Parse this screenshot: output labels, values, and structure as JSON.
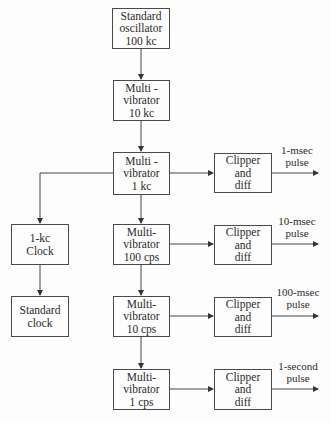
{
  "diagram": {
    "type": "block-diagram",
    "blocks": {
      "oscillator": {
        "label": "Standard\noscillator\n100 kc"
      },
      "mv_10kc": {
        "label": "Multi -\nvibrator\n10 kc"
      },
      "mv_1kc": {
        "label": "Multi -\nvibrator\n1 kc"
      },
      "mv_100cps": {
        "label": "Multi-\nvibrator\n100 cps"
      },
      "mv_10cps": {
        "label": "Multi-\nvibrator\n10 cps"
      },
      "mv_1cps": {
        "label": "Multi-\nvibrator\n1 cps"
      },
      "clock_1kc": {
        "label": "1-kc\nClock"
      },
      "standard_clock": {
        "label": "Standard\nclock"
      },
      "clipper_1": {
        "label": "Clipper\nand\ndiff"
      },
      "clipper_2": {
        "label": "Clipper\nand\ndiff"
      },
      "clipper_3": {
        "label": "Clipper\nand\ndiff"
      },
      "clipper_4": {
        "label": "Clipper\nand\ndiff"
      }
    },
    "outputs": {
      "out_1": {
        "label": "1-msec\npulse"
      },
      "out_2": {
        "label": "10-msec\npulse"
      },
      "out_3": {
        "label": "100-msec\npulse"
      },
      "out_4": {
        "label": "1-second\npulse"
      }
    },
    "connections": [
      [
        "oscillator",
        "mv_10kc"
      ],
      [
        "mv_10kc",
        "mv_1kc"
      ],
      [
        "mv_1kc",
        "clipper_1"
      ],
      [
        "mv_1kc",
        "clock_1kc"
      ],
      [
        "mv_1kc",
        "mv_100cps"
      ],
      [
        "clock_1kc",
        "standard_clock"
      ],
      [
        "mv_100cps",
        "clipper_2"
      ],
      [
        "mv_100cps",
        "mv_10cps"
      ],
      [
        "mv_10cps",
        "clipper_3"
      ],
      [
        "mv_10cps",
        "mv_1cps"
      ],
      [
        "mv_1cps",
        "clipper_4"
      ],
      [
        "clipper_1",
        "out_1"
      ],
      [
        "clipper_2",
        "out_2"
      ],
      [
        "clipper_3",
        "out_3"
      ],
      [
        "clipper_4",
        "out_4"
      ]
    ]
  }
}
